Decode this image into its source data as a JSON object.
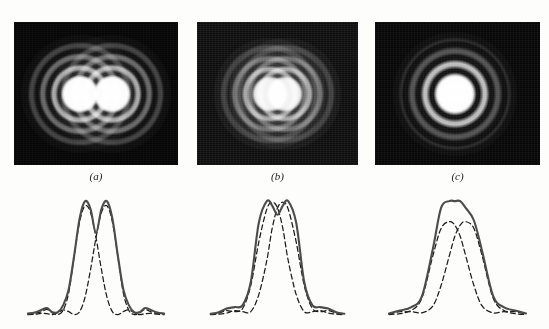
{
  "figure": {
    "background_color": "#fdfdfb",
    "curve_colors": {
      "sum": "#4c4c4c",
      "component": "#1c1c1c"
    },
    "plate_color": "#050505"
  },
  "panels": [
    {
      "id": "a",
      "caption": "(a)",
      "photo_description": "two clearly separated Airy disks with concentric diffraction rings",
      "state": "well resolved"
    },
    {
      "id": "b",
      "caption": "(b)",
      "photo_description": "two overlapping Airy disks merged into an elongated bright blob, Rayleigh criterion",
      "state": "just resolved"
    },
    {
      "id": "c",
      "caption": "(c)",
      "photo_description": "single circular Airy disk with surrounding rings, sources indistinguishable",
      "state": "unresolved"
    }
  ],
  "chart_data": [
    {
      "type": "line",
      "panel": "a",
      "title": "",
      "xlabel": "",
      "ylabel": "",
      "xlim": [
        0,
        1
      ],
      "ylim": [
        0,
        1
      ],
      "grid": false,
      "legend": "none",
      "separation": 1.6,
      "series": [
        {
          "name": "component 1",
          "style": "dashed",
          "x": [
            0.0,
            0.05,
            0.1,
            0.14,
            0.18,
            0.22,
            0.26,
            0.3,
            0.34,
            0.38,
            0.42,
            0.46,
            0.5,
            0.54,
            0.58,
            0.62,
            0.66,
            0.7,
            0.74,
            0.78,
            0.82,
            0.86,
            0.9,
            0.95,
            1.0
          ],
          "y": [
            0.01,
            0.015,
            0.03,
            0.05,
            0.02,
            0.005,
            0.045,
            0.2,
            0.52,
            0.82,
            0.96,
            0.9,
            0.68,
            0.4,
            0.16,
            0.03,
            0.005,
            0.03,
            0.045,
            0.022,
            0.004,
            0.012,
            0.016,
            0.008,
            0.004
          ]
        },
        {
          "name": "component 2",
          "style": "dashed",
          "x": [
            0.0,
            0.05,
            0.1,
            0.14,
            0.18,
            0.22,
            0.26,
            0.3,
            0.34,
            0.38,
            0.42,
            0.46,
            0.5,
            0.54,
            0.58,
            0.62,
            0.66,
            0.7,
            0.74,
            0.78,
            0.82,
            0.86,
            0.9,
            0.95,
            1.0
          ],
          "y": [
            0.004,
            0.008,
            0.016,
            0.012,
            0.004,
            0.022,
            0.045,
            0.03,
            0.005,
            0.03,
            0.16,
            0.4,
            0.68,
            0.9,
            0.96,
            0.82,
            0.52,
            0.2,
            0.045,
            0.005,
            0.02,
            0.05,
            0.03,
            0.015,
            0.01
          ]
        },
        {
          "name": "sum",
          "style": "solid",
          "x": [
            0.0,
            0.05,
            0.1,
            0.14,
            0.18,
            0.22,
            0.26,
            0.3,
            0.34,
            0.38,
            0.42,
            0.46,
            0.5,
            0.54,
            0.58,
            0.62,
            0.66,
            0.7,
            0.74,
            0.78,
            0.82,
            0.86,
            0.9,
            0.95,
            1.0
          ],
          "y": [
            0.014,
            0.023,
            0.046,
            0.062,
            0.024,
            0.027,
            0.09,
            0.23,
            0.525,
            0.85,
            1.0,
            0.93,
            0.72,
            0.93,
            1.0,
            0.85,
            0.525,
            0.23,
            0.09,
            0.027,
            0.024,
            0.062,
            0.046,
            0.023,
            0.014
          ]
        }
      ],
      "dip_depth": 0.28,
      "notes": "deep central minimum, peaks fully separated"
    },
    {
      "type": "line",
      "panel": "b",
      "title": "",
      "xlabel": "",
      "ylabel": "",
      "xlim": [
        0,
        1
      ],
      "ylim": [
        0,
        1
      ],
      "grid": false,
      "legend": "none",
      "separation": 1.0,
      "series": [
        {
          "name": "component 1",
          "style": "dashed",
          "x": [
            0.0,
            0.06,
            0.12,
            0.18,
            0.24,
            0.3,
            0.36,
            0.42,
            0.46,
            0.5,
            0.54,
            0.58,
            0.64,
            0.7,
            0.76,
            0.82,
            0.88,
            0.94,
            1.0
          ],
          "y": [
            0.008,
            0.018,
            0.04,
            0.03,
            0.06,
            0.26,
            0.64,
            0.93,
            0.99,
            0.94,
            0.76,
            0.48,
            0.18,
            0.03,
            0.03,
            0.04,
            0.018,
            0.008,
            0.004
          ]
        },
        {
          "name": "component 2",
          "style": "dashed",
          "x": [
            0.0,
            0.06,
            0.12,
            0.18,
            0.24,
            0.3,
            0.36,
            0.42,
            0.46,
            0.5,
            0.54,
            0.58,
            0.64,
            0.7,
            0.76,
            0.82,
            0.88,
            0.94,
            1.0
          ],
          "y": [
            0.004,
            0.008,
            0.018,
            0.04,
            0.03,
            0.03,
            0.18,
            0.48,
            0.76,
            0.94,
            0.99,
            0.93,
            0.64,
            0.26,
            0.06,
            0.03,
            0.04,
            0.018,
            0.008
          ]
        },
        {
          "name": "sum",
          "style": "solid",
          "x": [
            0.0,
            0.06,
            0.12,
            0.18,
            0.24,
            0.3,
            0.36,
            0.42,
            0.46,
            0.5,
            0.54,
            0.58,
            0.64,
            0.7,
            0.76,
            0.82,
            0.88,
            0.94,
            1.0
          ],
          "y": [
            0.012,
            0.026,
            0.058,
            0.07,
            0.088,
            0.29,
            0.81,
            1.0,
            0.96,
            0.88,
            0.96,
            1.0,
            0.81,
            0.29,
            0.088,
            0.07,
            0.058,
            0.026,
            0.012
          ]
        }
      ],
      "dip_depth": 0.82,
      "notes": "shallow saddle at centre, Rayleigh criterion just satisfied"
    },
    {
      "type": "line",
      "panel": "c",
      "title": "",
      "xlabel": "",
      "ylabel": "",
      "xlim": [
        0,
        1
      ],
      "ylim": [
        0,
        1
      ],
      "grid": false,
      "legend": "none",
      "separation": 0.5,
      "series": [
        {
          "name": "component 1",
          "style": "dashed",
          "x": [
            0.0,
            0.08,
            0.16,
            0.24,
            0.32,
            0.38,
            0.44,
            0.48,
            0.52,
            0.56,
            0.62,
            0.68,
            0.76,
            0.84,
            0.92,
            1.0
          ],
          "y": [
            0.01,
            0.03,
            0.04,
            0.15,
            0.52,
            0.76,
            0.82,
            0.79,
            0.69,
            0.52,
            0.26,
            0.08,
            0.02,
            0.03,
            0.012,
            0.005
          ]
        },
        {
          "name": "component 2",
          "style": "dashed",
          "x": [
            0.0,
            0.08,
            0.16,
            0.24,
            0.32,
            0.38,
            0.44,
            0.48,
            0.52,
            0.56,
            0.62,
            0.68,
            0.76,
            0.84,
            0.92,
            1.0
          ],
          "y": [
            0.005,
            0.012,
            0.03,
            0.02,
            0.08,
            0.26,
            0.52,
            0.69,
            0.79,
            0.82,
            0.76,
            0.52,
            0.15,
            0.04,
            0.03,
            0.01
          ]
        },
        {
          "name": "sum",
          "style": "solid",
          "x": [
            0.0,
            0.08,
            0.16,
            0.24,
            0.32,
            0.38,
            0.44,
            0.48,
            0.52,
            0.56,
            0.62,
            0.68,
            0.76,
            0.84,
            0.92,
            1.0
          ],
          "y": [
            0.014,
            0.041,
            0.068,
            0.165,
            0.58,
            0.94,
            1.0,
            1.0,
            1.0,
            0.94,
            0.83,
            0.56,
            0.168,
            0.068,
            0.041,
            0.014
          ]
        }
      ],
      "dip_depth": 1.0,
      "notes": "single rounded maximum, two sources not resolved"
    }
  ]
}
